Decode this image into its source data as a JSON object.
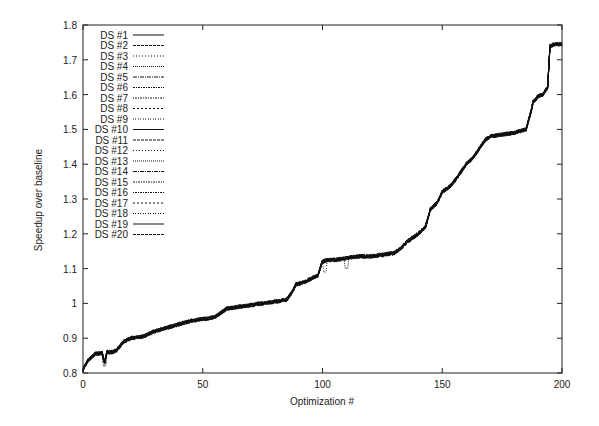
{
  "chart_data": {
    "type": "line",
    "title": "",
    "xlabel": "Optimization #",
    "ylabel": "Speedup over baseline",
    "xlim": [
      0,
      200
    ],
    "ylim": [
      0.8,
      1.8
    ],
    "xticks": [
      0,
      50,
      100,
      150,
      200
    ],
    "yticks": [
      0.8,
      0.9,
      1,
      1.1,
      1.2,
      1.3,
      1.4,
      1.5,
      1.6,
      1.7,
      1.8
    ],
    "ytick_labels": [
      "0.8",
      "0.9",
      "1",
      "1.1",
      "1.2",
      "1.3",
      "1.4",
      "1.5",
      "1.6",
      "1.7",
      "1.8"
    ],
    "grid": false,
    "legend_position": "upper-left",
    "legend": [
      "DS #1",
      "DS #2",
      "DS #3",
      "DS #4",
      "DS #5",
      "DS #6",
      "DS #7",
      "DS #8",
      "DS #9",
      "DS #10",
      "DS #11",
      "DS #12",
      "DS #13",
      "DS #14",
      "DS #15",
      "DS #16",
      "DS #17",
      "DS #18",
      "DS #19",
      "DS #20"
    ],
    "x": [
      0,
      2,
      5,
      8,
      9,
      10,
      12,
      14,
      17,
      20,
      25,
      30,
      35,
      40,
      45,
      50,
      55,
      60,
      65,
      70,
      75,
      80,
      85,
      87,
      89,
      92,
      95,
      98,
      100,
      102,
      105,
      110,
      115,
      120,
      125,
      130,
      133,
      135,
      138,
      140,
      143,
      145,
      148,
      150,
      153,
      155,
      158,
      160,
      163,
      165,
      168,
      170,
      175,
      180,
      185,
      187,
      188,
      190,
      192,
      194,
      195,
      197,
      200
    ],
    "series_mean": [
      0.81,
      0.835,
      0.855,
      0.857,
      0.83,
      0.86,
      0.86,
      0.865,
      0.89,
      0.9,
      0.905,
      0.92,
      0.93,
      0.94,
      0.95,
      0.955,
      0.96,
      0.985,
      0.99,
      0.995,
      1.0,
      1.005,
      1.01,
      1.03,
      1.055,
      1.06,
      1.07,
      1.08,
      1.12,
      1.125,
      1.125,
      1.13,
      1.135,
      1.135,
      1.14,
      1.145,
      1.16,
      1.175,
      1.19,
      1.2,
      1.22,
      1.27,
      1.29,
      1.32,
      1.335,
      1.35,
      1.38,
      1.4,
      1.42,
      1.44,
      1.47,
      1.48,
      1.485,
      1.49,
      1.5,
      1.55,
      1.58,
      1.595,
      1.6,
      1.62,
      1.74,
      1.745,
      1.745
    ],
    "series_note": "20 nearly overlapping series (DS #1 through DS #20), each following the mean curve with small noise"
  }
}
